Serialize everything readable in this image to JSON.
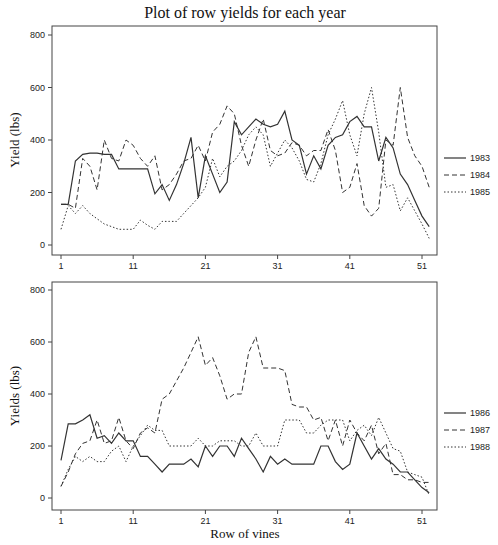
{
  "chart_data": [
    {
      "type": "line",
      "title": "Plot of row yields for each year",
      "xlabel": "",
      "ylabel": "Yield (lbs)",
      "ylim": [
        0,
        800
      ],
      "xlim": [
        1,
        52
      ],
      "xticks": [
        1,
        11,
        21,
        31,
        41,
        51
      ],
      "yticks": [
        0,
        200,
        400,
        600,
        800
      ],
      "grid": false,
      "legend_position": "right",
      "x": [
        1,
        2,
        3,
        4,
        5,
        6,
        7,
        8,
        9,
        10,
        11,
        12,
        13,
        14,
        15,
        16,
        17,
        18,
        19,
        20,
        21,
        22,
        23,
        24,
        25,
        26,
        27,
        28,
        29,
        30,
        31,
        32,
        33,
        34,
        35,
        36,
        37,
        38,
        39,
        40,
        41,
        42,
        43,
        44,
        45,
        46,
        47,
        48,
        49,
        50,
        51,
        52
      ],
      "series": [
        {
          "name": "1983",
          "style": "solid",
          "values": [
            155,
            155,
            320,
            345,
            350,
            350,
            345,
            345,
            290,
            290,
            290,
            290,
            290,
            195,
            230,
            170,
            230,
            310,
            410,
            180,
            340,
            270,
            200,
            240,
            470,
            420,
            450,
            480,
            460,
            450,
            460,
            510,
            400,
            380,
            270,
            340,
            290,
            380,
            410,
            420,
            470,
            490,
            450,
            450,
            320,
            410,
            370,
            270,
            230,
            170,
            110,
            70
          ]
        },
        {
          "name": "1984",
          "style": "dashed",
          "values": [
            155,
            155,
            140,
            330,
            300,
            210,
            400,
            330,
            320,
            400,
            380,
            330,
            300,
            340,
            210,
            230,
            270,
            320,
            330,
            380,
            320,
            430,
            460,
            530,
            500,
            380,
            300,
            400,
            480,
            360,
            340,
            350,
            390,
            380,
            340,
            360,
            360,
            440,
            360,
            200,
            220,
            310,
            150,
            110,
            140,
            400,
            380,
            600,
            410,
            340,
            300,
            220
          ]
        },
        {
          "name": "1985",
          "style": "dotted",
          "values": [
            60,
            150,
            120,
            150,
            120,
            100,
            80,
            70,
            60,
            60,
            60,
            95,
            75,
            60,
            90,
            90,
            90,
            120,
            150,
            180,
            220,
            330,
            260,
            300,
            320,
            360,
            420,
            450,
            420,
            300,
            350,
            400,
            370,
            320,
            250,
            240,
            310,
            420,
            480,
            550,
            420,
            340,
            500,
            600,
            430,
            220,
            230,
            130,
            180,
            130,
            80,
            25
          ]
        }
      ]
    },
    {
      "type": "line",
      "title": "",
      "xlabel": "Row of vines",
      "ylabel": "Yields (lbs)",
      "ylim": [
        0,
        800
      ],
      "xlim": [
        1,
        52
      ],
      "xticks": [
        1,
        11,
        21,
        31,
        41,
        51
      ],
      "yticks": [
        0,
        200,
        400,
        600,
        800
      ],
      "grid": false,
      "legend_position": "right",
      "x": [
        1,
        2,
        3,
        4,
        5,
        6,
        7,
        8,
        9,
        10,
        11,
        12,
        13,
        14,
        15,
        16,
        17,
        18,
        19,
        20,
        21,
        22,
        23,
        24,
        25,
        26,
        27,
        28,
        29,
        30,
        31,
        32,
        33,
        34,
        35,
        36,
        37,
        38,
        39,
        40,
        41,
        42,
        43,
        44,
        45,
        46,
        47,
        48,
        49,
        50,
        51,
        52
      ],
      "series": [
        {
          "name": "1986",
          "style": "solid",
          "values": [
            145,
            285,
            285,
            300,
            320,
            230,
            240,
            210,
            250,
            220,
            220,
            160,
            160,
            130,
            100,
            130,
            130,
            130,
            150,
            120,
            200,
            160,
            200,
            200,
            160,
            230,
            190,
            150,
            100,
            160,
            130,
            150,
            130,
            130,
            130,
            130,
            200,
            200,
            140,
            110,
            130,
            250,
            200,
            150,
            190,
            150,
            130,
            100,
            100,
            70,
            40,
            20
          ]
        },
        {
          "name": "1987",
          "style": "dashed",
          "values": [
            45,
            100,
            170,
            210,
            220,
            300,
            210,
            220,
            310,
            220,
            190,
            250,
            270,
            250,
            380,
            400,
            450,
            500,
            560,
            620,
            510,
            540,
            470,
            380,
            400,
            400,
            560,
            620,
            500,
            500,
            500,
            490,
            360,
            350,
            350,
            300,
            310,
            220,
            300,
            200,
            300,
            250,
            220,
            280,
            170,
            210,
            90,
            90,
            70,
            70,
            60,
            60
          ]
        },
        {
          "name": "1988",
          "style": "dotted",
          "values": [
            45,
            110,
            160,
            140,
            160,
            140,
            140,
            180,
            200,
            140,
            200,
            240,
            280,
            260,
            260,
            200,
            200,
            200,
            200,
            230,
            200,
            200,
            220,
            220,
            220,
            200,
            200,
            250,
            200,
            200,
            200,
            300,
            300,
            300,
            250,
            250,
            280,
            300,
            300,
            300,
            220,
            260,
            280,
            240,
            310,
            250,
            190,
            180,
            100,
            90,
            80,
            10
          ]
        }
      ]
    }
  ],
  "page": {
    "title": "Plot of row yields for each year",
    "top_panel": {
      "ylabel": "Yield (lbs)",
      "yticks": [
        "0",
        "200",
        "400",
        "600",
        "800"
      ],
      "xticks": [
        "1",
        "11",
        "21",
        "31",
        "41",
        "51"
      ],
      "legend": [
        "1983",
        "1984",
        "1985"
      ]
    },
    "bottom_panel": {
      "ylabel": "Yields (lbs)",
      "xlabel": "Row of vines",
      "yticks": [
        "0",
        "200",
        "400",
        "600",
        "800"
      ],
      "xticks": [
        "1",
        "11",
        "21",
        "31",
        "41",
        "51"
      ],
      "legend": [
        "1986",
        "1987",
        "1988"
      ]
    },
    "colors": {
      "line": "#333333",
      "frame": "#444444",
      "background": "#ffffff"
    }
  }
}
